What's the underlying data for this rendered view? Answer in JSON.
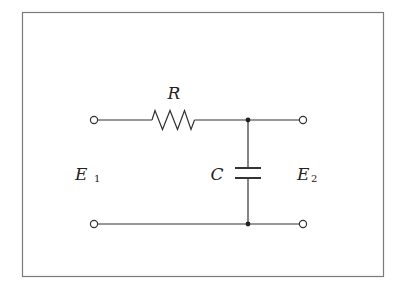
{
  "diagram": {
    "type": "RC low-pass filter circuit",
    "frame": {
      "x": 22,
      "y": 12,
      "width": 361,
      "height": 264,
      "stroke": "#7a7a7a"
    },
    "colors": {
      "wire": "#333333",
      "background": "#ffffff"
    },
    "components": {
      "resistor": {
        "label": "R"
      },
      "capacitor": {
        "label": "C"
      }
    },
    "ports": {
      "input": {
        "label": "E",
        "subscript": "1"
      },
      "output": {
        "label": "E",
        "subscript": "2"
      }
    },
    "nodes": {
      "top_left_terminal": {
        "x": 94,
        "y": 120
      },
      "top_right_terminal": {
        "x": 303,
        "y": 120
      },
      "bottom_left_terminal": {
        "x": 94,
        "y": 224
      },
      "bottom_right_terminal": {
        "x": 303,
        "y": 224
      },
      "top_junction": {
        "x": 248,
        "y": 120
      },
      "bottom_junction": {
        "x": 248,
        "y": 224
      }
    }
  }
}
